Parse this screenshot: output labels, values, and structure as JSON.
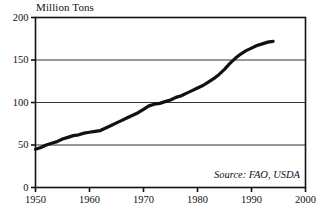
{
  "chart_data": {
    "type": "line",
    "title": "Million Tons",
    "xlabel": "",
    "ylabel": "Million Tons",
    "xlim": [
      1950,
      2000
    ],
    "ylim": [
      0,
      200
    ],
    "grid": true,
    "legend": null,
    "annotations": [
      {
        "text": "Source: FAO, USDA",
        "position": "bottom-right-inside"
      }
    ],
    "xticks": [
      1950,
      1960,
      1970,
      1980,
      1990,
      2000
    ],
    "xtick_labels": [
      "1950",
      "1960",
      "1970",
      "1980",
      "1990",
      "2000"
    ],
    "yticks": [
      0,
      50,
      100,
      150,
      200
    ],
    "ytick_labels": [
      "0",
      "50",
      "100",
      "150",
      "200"
    ],
    "series": [
      {
        "name": "World Fish Catch",
        "color": "#111111",
        "x": [
          1950,
          1951,
          1952,
          1953,
          1954,
          1955,
          1956,
          1957,
          1958,
          1959,
          1960,
          1961,
          1962,
          1963,
          1964,
          1965,
          1966,
          1967,
          1968,
          1969,
          1970,
          1971,
          1972,
          1973,
          1974,
          1975,
          1976,
          1977,
          1978,
          1979,
          1980,
          1981,
          1982,
          1983,
          1984,
          1985,
          1986,
          1987,
          1988,
          1989,
          1990,
          1991,
          1992,
          1993,
          1994
        ],
        "values": [
          45,
          47,
          50,
          52,
          54,
          57,
          59,
          61,
          62,
          64,
          65,
          66,
          67,
          70,
          73,
          76,
          79,
          82,
          85,
          88,
          92,
          96,
          98,
          99,
          101,
          103,
          106,
          108,
          111,
          114,
          117,
          120,
          124,
          128,
          133,
          139,
          146,
          152,
          157,
          161,
          164,
          167,
          169,
          171,
          172
        ]
      }
    ]
  }
}
